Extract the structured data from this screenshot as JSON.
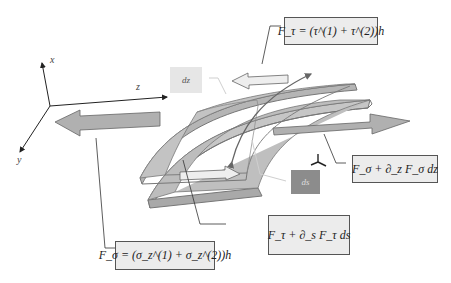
{
  "axes": {
    "x_label": "x",
    "y_label": "y",
    "z_label": "z"
  },
  "tags": {
    "dz": "dz",
    "ds": "ds"
  },
  "equations": {
    "f_tau": {
      "lhs": "F",
      "lhs_sub": "τ",
      "rhs": "= (τ(1) + τ(2))h",
      "display": "F_τ = (τ^(1) + τ^(2))h"
    },
    "f_sigma_dz": {
      "display": "F_σ + ∂_z F_σ dz"
    },
    "f_tau_ds": {
      "display": "F_τ + ∂_s F_τ ds"
    },
    "f_sigma": {
      "display": "F_σ = (σ_z^(1) + σ_z^(2))h"
    }
  },
  "colors": {
    "plate_fill": "#bdbdbd",
    "plate_edge": "#7a7a7a",
    "arrow_fill": "#b0b0b0",
    "white_arrow_fill": "#eeeeee",
    "eq_box_bg": "#ececec",
    "ds_tag_bg": "#8c8c8c",
    "dz_tag_bg": "#e6e6e6"
  }
}
